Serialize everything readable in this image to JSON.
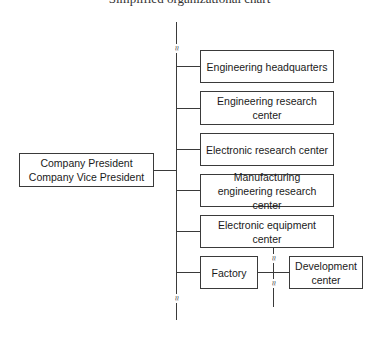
{
  "header": {
    "cropped_caption": "Simplified organizational chart"
  },
  "root": {
    "label_line1": "Company President",
    "label_line2": "Company Vice President"
  },
  "departments": [
    {
      "label": "Engineering headquarters"
    },
    {
      "label": "Engineering research center"
    },
    {
      "label": "Electronic research center"
    },
    {
      "label": "Manufacturing engineering research center"
    },
    {
      "label": "Electronic equipment center"
    },
    {
      "label": "Factory"
    }
  ],
  "sub_unit": {
    "label": "Development center"
  },
  "break_symbol": "≈",
  "colors": {
    "line": "#3a3a3a",
    "background": "#ffffff"
  }
}
